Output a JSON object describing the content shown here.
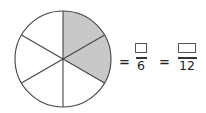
{
  "figure": {
    "circle": {
      "sectors": 6,
      "shaded_sectors": 2,
      "shaded_positions": [
        "12 o'clock to 2 o'clock",
        "2 o'clock to 4 o'clock"
      ],
      "fill_shaded": "#c8c8c8",
      "fill_unshaded": "#ffffff",
      "stroke": "#444444"
    },
    "equation": {
      "equals_1": "=",
      "fraction_1": {
        "numerator": "",
        "denominator": "6"
      },
      "equals_2": "=",
      "fraction_2": {
        "numerator": "",
        "denominator": "12"
      }
    }
  }
}
